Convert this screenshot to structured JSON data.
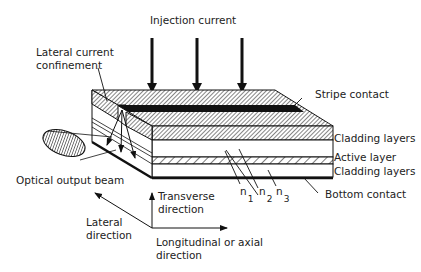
{
  "diagram": {
    "labels": {
      "injection_current": "Injection current",
      "lateral_confinement_1": "Lateral current",
      "lateral_confinement_2": "confinement",
      "stripe_contact": "Stripe contact",
      "cladding_top": "Cladding layers",
      "active_layer": "Active layer",
      "cladding_bottom": "Cladding layers",
      "bottom_contact": "Bottom contact",
      "optical_output": "Optical output beam",
      "n1": "n",
      "n1_sub": "1",
      "n2": "n",
      "n2_sub": "2",
      "n3": "n",
      "n3_sub": "3",
      "transverse_1": "Transverse",
      "transverse_2": "direction",
      "lateral_1": "Lateral",
      "lateral_2": "direction",
      "longitudinal_1": "Longitudinal or axial",
      "longitudinal_2": "direction"
    },
    "colors": {
      "line": "#111111",
      "hatch": "#555555",
      "background": "#ffffff"
    }
  }
}
